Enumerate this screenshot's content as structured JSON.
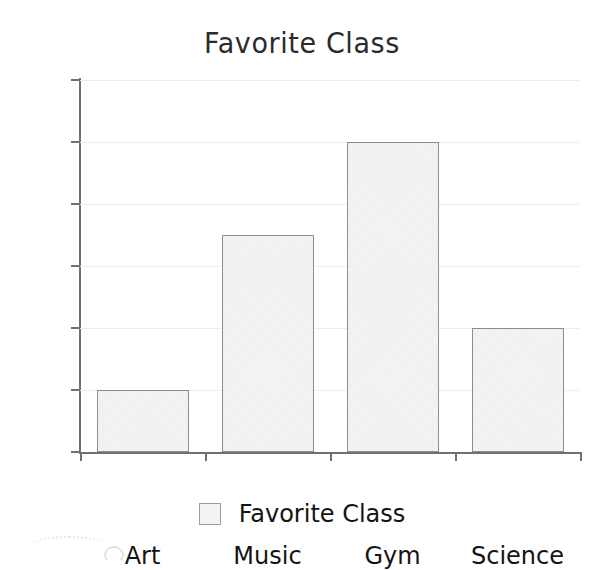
{
  "chart_data": {
    "type": "bar",
    "title": "Favorite Class",
    "xlabel": "",
    "ylabel": "",
    "categories": [
      "Art",
      "Music",
      "Gym",
      "Science"
    ],
    "values": [
      2,
      7,
      10,
      4
    ],
    "series": [
      {
        "name": "Favorite Class",
        "values": [
          2,
          7,
          10,
          4
        ]
      }
    ],
    "ylim": [
      0,
      12
    ],
    "ytick_labels": [
      "0",
      "2",
      "4",
      "6",
      "8",
      "10",
      "12"
    ],
    "ytick_values": [
      0,
      2,
      4,
      6,
      8,
      10,
      12
    ],
    "grid": true,
    "legend": {
      "position": "bottom",
      "entries": [
        {
          "label": "Favorite Class",
          "swatch": "legend-swatch-icon",
          "color": "#f4f4f4"
        }
      ]
    },
    "style": "hand-drawn",
    "colors": {
      "bar_fill": "#f4f4f4",
      "bar_edge": "#8b8d8f",
      "axis": "#6f7072",
      "grid": "#eceded",
      "text": "#141414",
      "background": "#ffffff"
    }
  }
}
